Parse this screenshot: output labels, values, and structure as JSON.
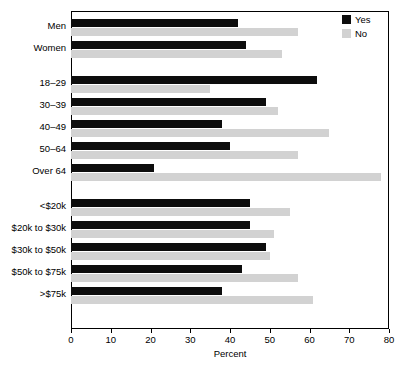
{
  "chart_data": {
    "type": "bar",
    "orientation": "horizontal",
    "title": "",
    "subtitle": "",
    "xlabel": "Percent",
    "ylabel": "",
    "xlim": [
      0,
      80
    ],
    "xticks": [
      0,
      10,
      20,
      30,
      40,
      50,
      60,
      70,
      80
    ],
    "xtick_labels": [
      "0",
      "10",
      "20",
      "30",
      "40",
      "50",
      "60",
      "70",
      "80"
    ],
    "grid": false,
    "legend_position": "top-right",
    "categories": [
      "Men",
      "Women",
      "18–29",
      "30–39",
      "40–49",
      "50–64",
      "Over 64",
      "<$20k",
      "$20k to $30k",
      "$30k to $50k",
      "$50k to $75k",
      ">$75k"
    ],
    "group_breaks_after": [
      "Women",
      "Over 64"
    ],
    "series": [
      {
        "name": "Yes",
        "color": "#0d0d0d",
        "values": [
          42,
          44,
          62,
          49,
          38,
          40,
          21,
          45,
          45,
          49,
          43,
          38
        ]
      },
      {
        "name": "No",
        "color": "#d2d2d2",
        "values": [
          57,
          53,
          35,
          52,
          65,
          57,
          78,
          55,
          51,
          50,
          57,
          61
        ]
      }
    ]
  },
  "legend": {
    "items": [
      {
        "label": "Yes",
        "color": "#0d0d0d",
        "swatch_name": "legend-swatch-yes"
      },
      {
        "label": "No",
        "color": "#d2d2d2",
        "swatch_name": "legend-swatch-no"
      }
    ]
  }
}
